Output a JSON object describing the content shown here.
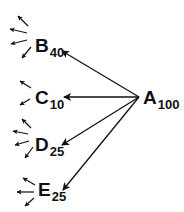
{
  "diagram": {
    "type": "branching-decay-tree",
    "colors": {
      "line": "#111111",
      "background": "#ffffff"
    },
    "source": {
      "id": "A",
      "letter": "A",
      "value": "100"
    },
    "targets": [
      {
        "id": "B",
        "letter": "B",
        "value": "40",
        "outgoing_small_arrows": 4
      },
      {
        "id": "C",
        "letter": "C",
        "value": "10",
        "outgoing_small_arrows": 2
      },
      {
        "id": "D",
        "letter": "D",
        "value": "25",
        "outgoing_small_arrows": 4
      },
      {
        "id": "E",
        "letter": "E",
        "value": "25",
        "outgoing_small_arrows": 3
      }
    ],
    "edges": [
      {
        "from": "A",
        "to": "B"
      },
      {
        "from": "A",
        "to": "C"
      },
      {
        "from": "A",
        "to": "D"
      },
      {
        "from": "A",
        "to": "E"
      }
    ]
  }
}
